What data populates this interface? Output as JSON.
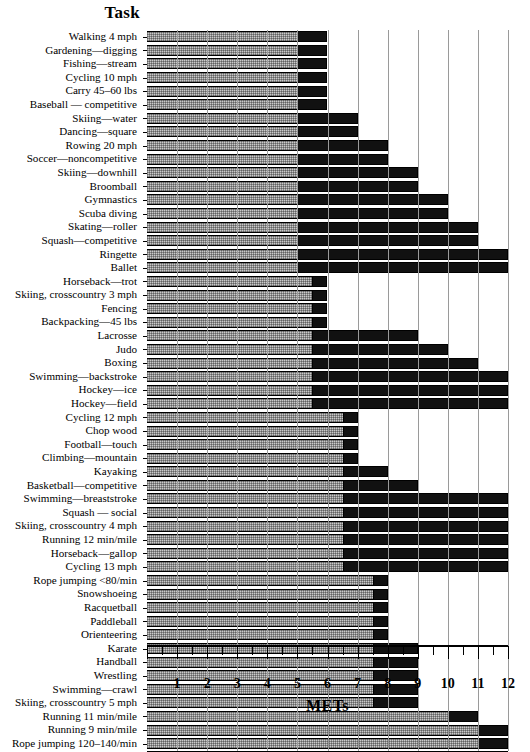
{
  "header": {
    "task_column_title": "Task"
  },
  "chart_data": {
    "type": "bar",
    "orientation": "horizontal",
    "title": "",
    "xlabel": "METs",
    "ylabel": "Task",
    "xlim": [
      0,
      12
    ],
    "xticks": [
      0,
      1,
      2,
      3,
      4,
      5,
      6,
      7,
      8,
      9,
      10,
      11,
      12
    ],
    "xticklabels": [
      "",
      "1",
      "2",
      "3",
      "4",
      "5",
      "6",
      "7",
      "8",
      "9",
      "10",
      "11",
      "12"
    ],
    "minor_tick_step": 0.5,
    "grid": "vertical-gridlines-at-integers",
    "legend": "none",
    "colors": {
      "bar_low_segment": "#c9c9c9",
      "bar_high_segment": "#111111",
      "gridline": "#9a9a9a",
      "axis": "#000000",
      "background": "#ffffff"
    },
    "categories": [
      "Walking 4 mph",
      "Gardening—digging",
      "Fishing—stream",
      "Cycling 10 mph",
      "Carry 45–60 lbs",
      "Baseball — competitive",
      "Skiing—water",
      "Dancing—square",
      "Rowing 20 mph",
      "Soccer—noncompetitive",
      "Skiing—downhill",
      "Broomball",
      "Gymnastics",
      "Scuba diving",
      "Skating—roller",
      "Squash—competitive",
      "Ringette",
      "Ballet",
      "Horseback—trot",
      "Skiing, crosscountry 3 mph",
      "Fencing",
      "Backpacking—45 lbs",
      "Lacrosse",
      "Judo",
      "Boxing",
      "Swimming—backstroke",
      "Hockey—ice",
      "Hockey—field",
      "Cycling 12 mph",
      "Chop wood",
      "Football—touch",
      "Climbing—mountain",
      "Kayaking",
      "Basketball—competitive",
      "Swimming—breaststroke",
      "Squash — social",
      "Skiing, crosscountry 4 mph",
      "Running 12 min/mile",
      "Horseback—gallop",
      "Cycling 13 mph",
      "Rope jumping <80/min",
      "Snowshoeing",
      "Racquetball",
      "Paddleball",
      "Orienteering",
      "Karate",
      "Handball",
      "Wrestling",
      "Swimming—crawl",
      "Skiing, crosscountry 5 mph",
      "Running 11 min/mile",
      "Running 9 min/mile",
      "Rope jumping 120–140/min"
    ],
    "values": [
      6,
      6,
      6,
      6,
      6,
      6,
      7,
      7,
      8,
      8,
      9,
      9,
      10,
      10,
      11,
      11,
      12,
      12,
      6,
      6,
      6,
      6,
      9,
      10,
      11,
      12,
      12,
      12,
      7,
      7,
      7,
      7,
      8,
      9,
      12,
      12,
      12,
      12,
      12,
      12,
      8,
      8,
      8,
      8,
      8,
      9,
      9,
      9,
      9,
      9,
      11,
      12,
      12
    ],
    "thresholds": [
      5,
      5,
      5,
      5,
      5,
      5,
      5,
      5,
      5,
      5,
      5,
      5,
      5,
      5,
      5,
      5,
      5,
      5,
      5.5,
      5.5,
      5.5,
      5.5,
      5.5,
      5.5,
      5.5,
      5.5,
      5.5,
      5.5,
      6.5,
      6.5,
      6.5,
      6.5,
      6.5,
      6.5,
      6.5,
      6.5,
      6.5,
      6.5,
      6.5,
      6.5,
      7.5,
      7.5,
      7.5,
      7.5,
      7.5,
      7.5,
      7.5,
      7.5,
      7.5,
      7.5,
      10,
      11,
      11
    ]
  }
}
